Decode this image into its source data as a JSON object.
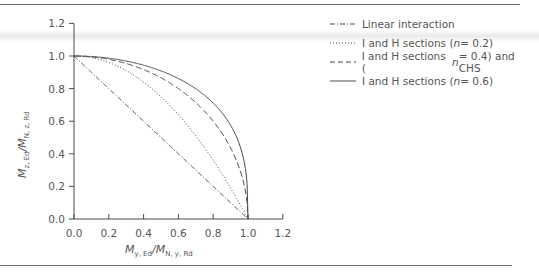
{
  "chart_data": {
    "type": "line",
    "title": "",
    "xlabel": "M_y,Ed / M_N,y,Rd",
    "ylabel": "M_z,Ed / M_N,z,Rd",
    "xlim": [
      0,
      1.2
    ],
    "ylim": [
      0,
      1.2
    ],
    "xticks": [
      "0.0",
      "0.2",
      "0.4",
      "0.6",
      "0.8",
      "1.0",
      "1.2"
    ],
    "yticks": [
      "0.0",
      "0.2",
      "0.4",
      "0.6",
      "0.8",
      "1.0",
      "1.2"
    ],
    "grid": false,
    "legend_position": "upper right (outside plot)",
    "series": [
      {
        "name": "Linear interaction",
        "style": "dash-dot",
        "alpha": 1,
        "beta": 1
      },
      {
        "name": "I and H sections (n = 0.2)",
        "style": "dotted",
        "alpha": 2,
        "beta": 1
      },
      {
        "name": "I and H sections (n = 0.4) and CHS",
        "style": "dashed",
        "alpha": 2,
        "beta": 2
      },
      {
        "name": "I and H sections (n = 0.6)",
        "style": "solid",
        "alpha": 2,
        "beta": 3
      }
    ],
    "equation": "(x)^alpha + (y)^beta = 1"
  },
  "axes": {
    "x_label_main": "M",
    "x_label_sub1": "y, Ed",
    "x_label_sep": "/M",
    "x_label_sub2": "N, y, Rd",
    "y_label_main": "M",
    "y_label_sub1": "z, Ed",
    "y_label_sep": "/M",
    "y_label_sub2": "N, z, Rd"
  },
  "legend": {
    "items": [
      {
        "pre": "Linear interaction",
        "n": "",
        "post": ""
      },
      {
        "pre": "I and H sections (",
        "n": "n",
        "post": " = 0.2)"
      },
      {
        "pre": "I and H sections (",
        "n": "n",
        "post": " = 0.4) and CHS"
      },
      {
        "pre": "I and H sections (",
        "n": "n",
        "post": " = 0.6)"
      }
    ]
  },
  "colors": {
    "ink": "#555555",
    "curve": "#4a4a4a"
  }
}
